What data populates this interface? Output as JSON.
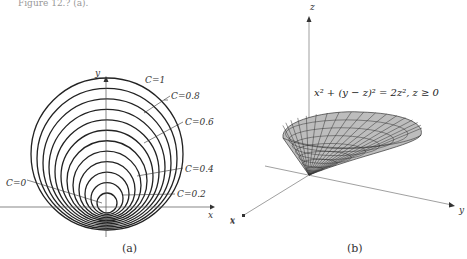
{
  "top_text": "Figure 12.? (a).",
  "panel_a": {
    "caption": "(a)",
    "x_label": "x",
    "y_label": "y",
    "outer_x_label": "x",
    "curve_labels": [
      "C=1",
      "C=0.8",
      "C=0.6",
      "C=0.4",
      "C=0.2",
      "C=0"
    ],
    "circle_count": 12
  },
  "panel_b": {
    "caption": "(b)",
    "equation": "x² + (y − z)² = 2z², z ≥ 0",
    "axis_labels": {
      "x": "x",
      "y": "y",
      "z": "z"
    },
    "surface_fill": "#b8b8b8"
  },
  "colors": {
    "ink": "#222222",
    "axis": "#666666",
    "surface": "#b8b8b8"
  }
}
